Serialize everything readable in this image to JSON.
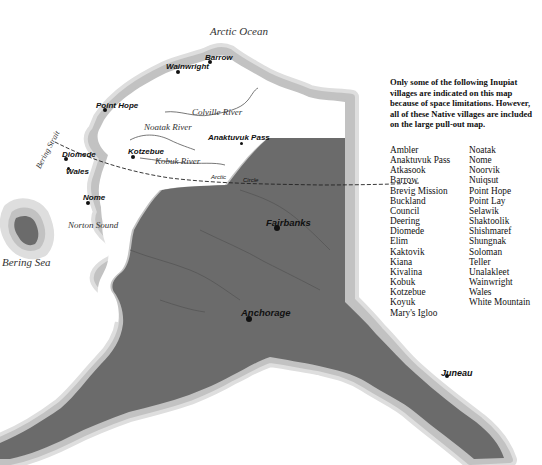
{
  "map": {
    "water_labels": {
      "arctic_ocean": "Arctic Ocean",
      "bering_sea": "Bering Sea",
      "norton_sound": "Norton Sound",
      "bering_strait": "Bering Strait"
    },
    "rivers": {
      "colville": "Colville River",
      "noatak": "Noatak River",
      "kobuk": "Kobuk River"
    },
    "arctic_circle": {
      "word1": "Arctic",
      "word2": "Circle"
    },
    "towns": {
      "barrow": "Barrow",
      "wainwright": "Wainwright",
      "point_hope": "Point Hope",
      "anaktuvuk_pass": "Anaktuvuk Pass",
      "kotzebue": "Kotzebue",
      "diomede": "Diomede",
      "wales": "Wales",
      "nome": "Nome",
      "fairbanks": "Fairbanks",
      "anchorage": "Anchorage",
      "juneau": "Juneau"
    },
    "colors": {
      "land_dark": "#6b6b6b",
      "land_light": "#ffffff",
      "coast_halo_outer": "#dcdcdc",
      "coast_halo_inner": "#bdbdbd",
      "text": "#111111"
    }
  },
  "note": "Only some of the following Inupiat villages are indicated on this map because of space limitations. However, all of these Native villages are included on the large pull-out map.",
  "villages": {
    "column1": [
      "Ambler",
      "Anaktuvuk Pass",
      "Atkasook",
      "Barrow",
      "Brevig Mission",
      "Buckland",
      "Council",
      "Deering",
      "Diomede",
      "Elim",
      "Kaktovik",
      "Kiana",
      "Kivalina",
      "Kobuk",
      "Kotzebue",
      "Koyuk",
      "Mary's Igloo"
    ],
    "column2": [
      "Noatak",
      "Nome",
      "Noorvik",
      "Nuiqsut",
      "Point Hope",
      "Point Lay",
      "Selawik",
      "Shaktoolik",
      "Shishmaref",
      "Shungnak",
      "Soloman",
      "Teller",
      "Unalakleet",
      "Wainwright",
      "Wales",
      "White Mountain"
    ]
  }
}
